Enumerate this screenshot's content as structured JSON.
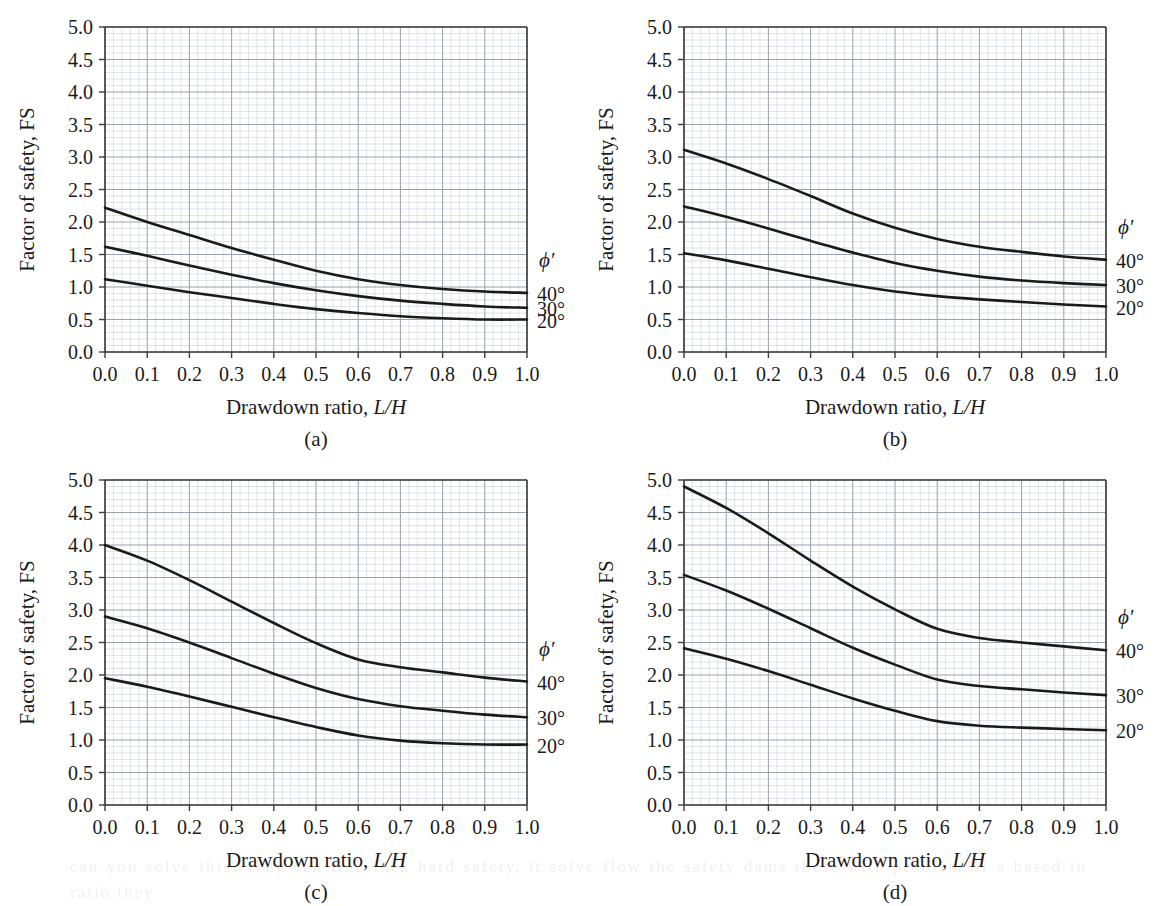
{
  "figure": {
    "panel_count": 4,
    "axis": {
      "xlabel_prefix": "Drawdown ratio, ",
      "xlabel_math": "L/H",
      "ylabel": "Factor of safety, FS",
      "xticks": [
        "0.0",
        "0.1",
        "0.2",
        "0.3",
        "0.4",
        "0.5",
        "0.6",
        "0.7",
        "0.8",
        "0.9",
        "1.0"
      ],
      "yticks": [
        "0.0",
        "0.5",
        "1.0",
        "1.5",
        "2.0",
        "2.5",
        "3.0",
        "3.5",
        "4.0",
        "4.5",
        "5.0"
      ],
      "xlim": [
        0.0,
        1.0
      ],
      "ylim": [
        0.0,
        5.0
      ],
      "grid": "minor-and-major",
      "minor_per_major_x": 5,
      "minor_per_major_y": 5
    },
    "legend": {
      "header": "ϕ′",
      "entries": [
        "40°",
        "30°",
        "20°"
      ],
      "position": "right-outside"
    },
    "colors": {
      "curve": "#1a1a1a",
      "axis": "#3c3c3c",
      "major_grid": "#9aa0ac",
      "minor_grid": "#cdd2db",
      "background": "#ffffff",
      "text": "#1a1a1a"
    },
    "bleed_text": "can you solve this? they can find then hard safety, it solve flow the safety dams these with problem of a based in ratio they"
  },
  "chart_data": [
    {
      "type": "line",
      "panel": "(a)",
      "title": "",
      "xlabel": "Drawdown ratio, L/H",
      "ylabel": "Factor of safety, FS",
      "xlim": [
        0.0,
        1.0
      ],
      "ylim": [
        0.0,
        5.0
      ],
      "x": [
        0.0,
        0.1,
        0.2,
        0.3,
        0.4,
        0.5,
        0.6,
        0.7,
        0.8,
        0.9,
        1.0
      ],
      "series": [
        {
          "name": "40°",
          "values": [
            2.22,
            2.0,
            1.8,
            1.6,
            1.42,
            1.25,
            1.12,
            1.03,
            0.97,
            0.93,
            0.91
          ]
        },
        {
          "name": "30°",
          "values": [
            1.62,
            1.48,
            1.33,
            1.19,
            1.06,
            0.95,
            0.86,
            0.79,
            0.74,
            0.7,
            0.68
          ]
        },
        {
          "name": "20°",
          "values": [
            1.12,
            1.02,
            0.92,
            0.83,
            0.74,
            0.66,
            0.6,
            0.55,
            0.52,
            0.5,
            0.5
          ]
        }
      ]
    },
    {
      "type": "line",
      "panel": "(b)",
      "title": "",
      "xlabel": "Drawdown ratio, L/H",
      "ylabel": "Factor of safety, FS",
      "xlim": [
        0.0,
        1.0
      ],
      "ylim": [
        0.0,
        5.0
      ],
      "x": [
        0.0,
        0.1,
        0.2,
        0.3,
        0.4,
        0.5,
        0.6,
        0.7,
        0.8,
        0.9,
        1.0
      ],
      "series": [
        {
          "name": "40°",
          "values": [
            3.11,
            2.9,
            2.66,
            2.4,
            2.13,
            1.91,
            1.74,
            1.62,
            1.54,
            1.47,
            1.42
          ]
        },
        {
          "name": "30°",
          "values": [
            2.24,
            2.08,
            1.9,
            1.71,
            1.53,
            1.37,
            1.25,
            1.16,
            1.1,
            1.06,
            1.03
          ]
        },
        {
          "name": "20°",
          "values": [
            1.52,
            1.41,
            1.28,
            1.15,
            1.03,
            0.93,
            0.86,
            0.81,
            0.77,
            0.73,
            0.7
          ]
        }
      ]
    },
    {
      "type": "line",
      "panel": "(c)",
      "title": "",
      "xlabel": "Drawdown ratio, L/H",
      "ylabel": "Factor of safety, FS",
      "xlim": [
        0.0,
        1.0
      ],
      "ylim": [
        0.0,
        5.0
      ],
      "x": [
        0.0,
        0.1,
        0.2,
        0.3,
        0.4,
        0.5,
        0.6,
        0.7,
        0.8,
        0.9,
        1.0
      ],
      "series": [
        {
          "name": "40°",
          "values": [
            4.0,
            3.76,
            3.46,
            3.13,
            2.8,
            2.49,
            2.24,
            2.12,
            2.04,
            1.96,
            1.9
          ]
        },
        {
          "name": "30°",
          "values": [
            2.9,
            2.72,
            2.5,
            2.26,
            2.02,
            1.8,
            1.63,
            1.52,
            1.45,
            1.39,
            1.35
          ]
        },
        {
          "name": "20°",
          "values": [
            1.95,
            1.82,
            1.67,
            1.51,
            1.35,
            1.2,
            1.07,
            0.99,
            0.95,
            0.93,
            0.93
          ]
        }
      ]
    },
    {
      "type": "line",
      "panel": "(d)",
      "title": "",
      "xlabel": "Drawdown ratio, L/H",
      "ylabel": "Factor of safety, FS",
      "xlim": [
        0.0,
        1.0
      ],
      "ylim": [
        0.0,
        5.0
      ],
      "x": [
        0.0,
        0.1,
        0.2,
        0.3,
        0.4,
        0.5,
        0.6,
        0.7,
        0.8,
        0.9,
        1.0
      ],
      "series": [
        {
          "name": "40°",
          "values": [
            4.9,
            4.57,
            4.18,
            3.76,
            3.36,
            3.01,
            2.71,
            2.57,
            2.5,
            2.44,
            2.38
          ]
        },
        {
          "name": "30°",
          "values": [
            3.54,
            3.3,
            3.02,
            2.72,
            2.42,
            2.16,
            1.93,
            1.83,
            1.78,
            1.73,
            1.69
          ]
        },
        {
          "name": "20°",
          "values": [
            2.41,
            2.25,
            2.06,
            1.85,
            1.64,
            1.45,
            1.29,
            1.22,
            1.19,
            1.17,
            1.15
          ]
        }
      ]
    }
  ],
  "panels": [
    {
      "caption": "(a)"
    },
    {
      "caption": "(b)"
    },
    {
      "caption": "(c)"
    },
    {
      "caption": "(d)"
    }
  ]
}
